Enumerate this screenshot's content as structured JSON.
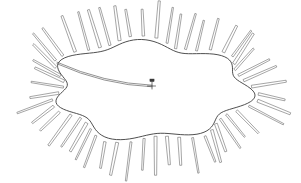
{
  "figure": {
    "background_color": "#ffffff",
    "canvas": {
      "width": 301,
      "height": 183
    },
    "style": {
      "blob_stroke_color": "#3b3b3b",
      "spoke_stroke_color": "#5b5b5b",
      "rod_stroke_color": "#4a4a4a",
      "pin_color": "#3a3a3a",
      "fill_color": "#ffffff",
      "blob_stroke_width": 0.9,
      "spoke_stroke_width": 0.55
    },
    "blob": {
      "name": "amoeboid-outline",
      "center": {
        "x": 150,
        "y": 90
      },
      "radius_x": 96,
      "radius_y": 46,
      "lobe_count": 7,
      "lobe_amplitude": 0.09
    },
    "spokes": {
      "name": "radiating-spokes",
      "count": 52,
      "inner_gap": 3,
      "length_min": 26,
      "length_max": 40,
      "width": 2.4,
      "tip_shape": "rounded"
    },
    "inner_rod": {
      "name": "internal-curved-rod",
      "start": {
        "x": 57,
        "y": 63
      },
      "control": {
        "x": 104,
        "y": 84
      },
      "end": {
        "x": 152,
        "y": 86
      },
      "thickness": 1.6
    },
    "pin": {
      "name": "pin-marker",
      "x": 152,
      "y": 86,
      "head_width": 4.2,
      "head_height": 2.6,
      "stem_length": 7
    }
  }
}
